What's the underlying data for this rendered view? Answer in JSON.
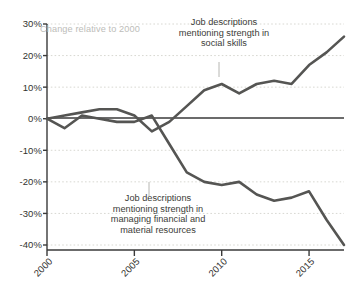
{
  "chart_data": {
    "type": "line",
    "title": "",
    "xlabel": "",
    "ylabel": "Change relative to 2000",
    "axis_note": "Change relative to 2000",
    "xlim": [
      2000,
      2017
    ],
    "ylim": [
      -40,
      30
    ],
    "grid": true,
    "legend": "annotations",
    "ytick_labels": [
      "30%",
      "20%",
      "10%",
      "0%",
      "-10%",
      "-20%",
      "-30%",
      "-40%"
    ],
    "ytick_values": [
      30,
      20,
      10,
      0,
      -10,
      -20,
      -30,
      -40
    ],
    "xtick_labels": [
      "2000",
      "2005",
      "2010",
      "2015"
    ],
    "xtick_values": [
      2000,
      2005,
      2010,
      2015
    ],
    "x": [
      2000,
      2001,
      2002,
      2003,
      2004,
      2005,
      2006,
      2007,
      2008,
      2009,
      2010,
      2011,
      2012,
      2013,
      2014,
      2015,
      2016,
      2017
    ],
    "series": [
      {
        "name": "Job descriptions mentioning strength in social skills",
        "color": "#555553",
        "annotation": "Job descriptions\nmentioning strength in\nsocial skills",
        "values": [
          0,
          1,
          2,
          3,
          3,
          1,
          -4,
          -1,
          4,
          9,
          11,
          8,
          11,
          12,
          11,
          17,
          21,
          26
        ]
      },
      {
        "name": "Job descriptions mentioning strength in managing financial and material resources",
        "color": "#555553",
        "annotation": "Job descriptions\nmentioning strength in\nmanaging financial and\nmaterial resources",
        "values": [
          0,
          -3,
          1,
          0,
          -1,
          -1,
          1,
          -8,
          -17,
          -20,
          -21,
          -20,
          -24,
          -26,
          -25,
          -23,
          -32,
          -40
        ]
      }
    ]
  },
  "annotations": {
    "social": "Job descriptions\nmentioning strength in\nsocial skills",
    "financial": "Job descriptions\nmentioning strength in\nmanaging financial and\nmaterial resources",
    "axis_note": "Change relative to 2000"
  }
}
